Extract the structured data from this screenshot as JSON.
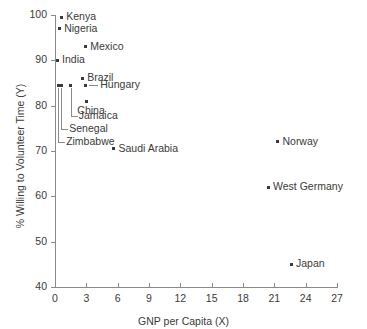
{
  "chart_data": {
    "type": "scatter",
    "title": "",
    "xlabel": "GNP per Capita (X)",
    "ylabel": "% Willing to Volunteer Time (Y)",
    "xlim": [
      0,
      27
    ],
    "ylim": [
      40,
      100
    ],
    "xticks": [
      "0",
      "3",
      "6",
      "9",
      "12",
      "15",
      "18",
      "21",
      "24",
      "27"
    ],
    "yticks": [
      "40",
      "50",
      "60",
      "70",
      "80",
      "90",
      "100"
    ],
    "grid": false,
    "legend": "none",
    "marker_color": "#3a3a3a",
    "axis_color": "#8a8a8a",
    "points": [
      {
        "label": "Kenya",
        "x": 0.6,
        "y": 99.5,
        "label_pos": "right"
      },
      {
        "label": "Nigeria",
        "x": 0.4,
        "y": 97.0,
        "label_pos": "right"
      },
      {
        "label": "Mexico",
        "x": 2.9,
        "y": 93.0,
        "label_pos": "right"
      },
      {
        "label": "India",
        "x": 0.2,
        "y": 90.0,
        "label_pos": "right"
      },
      {
        "label": "Brazil",
        "x": 2.6,
        "y": 86.0,
        "label_pos": "right"
      },
      {
        "label": "Hungary",
        "x": 2.9,
        "y": 84.5,
        "label_pos": "right-dash"
      },
      {
        "label": "China",
        "x": 3.0,
        "y": 81.0,
        "label_pos": "below"
      },
      {
        "label": "Jamaica",
        "x": 1.5,
        "y": 84.5,
        "label_pos": "leader"
      },
      {
        "label": "Senegal",
        "x": 0.6,
        "y": 84.5,
        "label_pos": "leader"
      },
      {
        "label": "Zimbabwe",
        "x": 0.3,
        "y": 84.5,
        "label_pos": "leader"
      },
      {
        "label": "Saudi Arabia",
        "x": 5.6,
        "y": 70.5,
        "label_pos": "right"
      },
      {
        "label": "Norway",
        "x": 21.3,
        "y": 72.0,
        "label_pos": "right"
      },
      {
        "label": "West Germany",
        "x": 20.4,
        "y": 62.0,
        "label_pos": "right"
      },
      {
        "label": "Japan",
        "x": 22.6,
        "y": 45.0,
        "label_pos": "right"
      }
    ]
  }
}
